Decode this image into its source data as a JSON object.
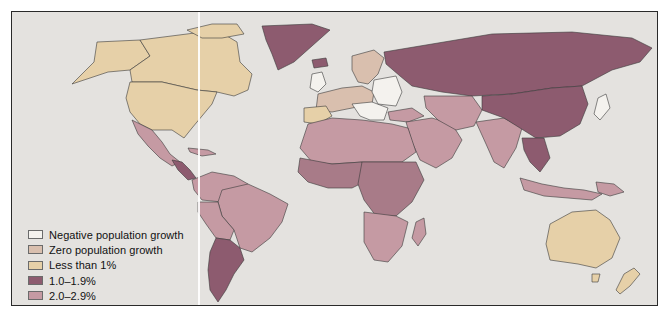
{
  "map": {
    "title": "",
    "type": "choropleth world map",
    "subject": "Population growth rate by country"
  },
  "legend": {
    "items": [
      {
        "label": "Negative population growth",
        "color": "#f4f2ee"
      },
      {
        "label": "Zero population growth",
        "color": "#d9bfae"
      },
      {
        "label": "Less than 1%",
        "color": "#e6d0a8"
      },
      {
        "label": "1.0–1.9%",
        "color": "#8d5b6f"
      },
      {
        "label": "2.0–2.9%",
        "color": "#c59aa3"
      },
      {
        "label": "More than 3%",
        "color": "#a87b88"
      }
    ]
  },
  "colors": {
    "ocean": "#e4e2df",
    "border": "#2a2a2a",
    "less_than_1": "#e6d0a8",
    "one_to_two": "#8d5b6f",
    "two_to_three": "#c59aa3",
    "more_than_3": "#a87b88",
    "zero": "#d9bfae",
    "negative": "#f4f2ee"
  }
}
